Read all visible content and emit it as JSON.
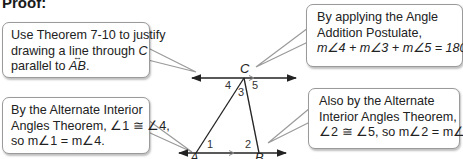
{
  "heading": "Proof:",
  "callouts": [
    {
      "id": "theorem-7-10",
      "lines": [
        "Use Theorem 7-10 to justify",
        "drawing a line through ",
        "parallel to "
      ],
      "line2_var": "C",
      "line3_var": "AB",
      "line3_end": "."
    },
    {
      "id": "angle-addition",
      "lines": [
        "By applying the Angle",
        "Addition Postulate,",
        "m∠4 + m∠3 + m∠5 = 180°."
      ]
    },
    {
      "id": "alt-interior-1",
      "lines": [
        "By the Alternate Interior",
        "Angles Theorem, ∠1 ≅ ∠4,",
        "so m∠1 = m∠4."
      ]
    },
    {
      "id": "alt-interior-2",
      "lines": [
        "Also by the Alternate",
        "Interior Angles Theorem,",
        "∠2 ≅ ∠5, so m∠2 = m∠5."
      ]
    }
  ],
  "diagram": {
    "points": {
      "A": "A",
      "B": "B",
      "C": "C"
    },
    "angles": {
      "a1": "1",
      "a2": "2",
      "a3": "3",
      "a4": "4",
      "a5": "5"
    }
  }
}
